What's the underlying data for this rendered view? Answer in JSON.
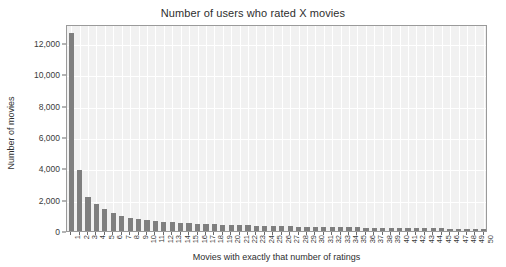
{
  "chart_data": {
    "type": "bar",
    "title": "Number of users who rated X movies",
    "xlabel": "Movies with exactly that number of ratings",
    "ylabel": "Number of movies",
    "grid": true,
    "legend": null,
    "ylim": [
      0,
      13200
    ],
    "xlim": [
      0.5,
      50.5
    ],
    "ytick_labels": [
      "0",
      "2,000",
      "4,000",
      "6,000",
      "8,000",
      "10,000",
      "12,000"
    ],
    "ytick_values": [
      0,
      2000,
      4000,
      6000,
      8000,
      10000,
      12000
    ],
    "categories": [
      "1",
      "2",
      "3",
      "4",
      "5",
      "6",
      "7",
      "8",
      "9",
      "10",
      "11",
      "12",
      "13",
      "14",
      "15",
      "16",
      "17",
      "18",
      "19",
      "20",
      "21",
      "22",
      "23",
      "24",
      "25",
      "26",
      "27",
      "28",
      "29",
      "30",
      "31",
      "32",
      "33",
      "34",
      "35",
      "36",
      "37",
      "38",
      "39",
      "40",
      "41",
      "42",
      "43",
      "44",
      "45",
      "46",
      "47",
      "48",
      "49",
      "50"
    ],
    "values": [
      12600,
      3900,
      2150,
      1750,
      1400,
      1150,
      980,
      860,
      760,
      700,
      640,
      600,
      550,
      520,
      500,
      470,
      450,
      430,
      410,
      400,
      380,
      360,
      350,
      340,
      330,
      300,
      290,
      280,
      270,
      260,
      250,
      245,
      240,
      235,
      225,
      220,
      210,
      205,
      200,
      195,
      185,
      180,
      175,
      170,
      165,
      160,
      155,
      150,
      145,
      140
    ],
    "colors": {
      "bar": "#7f7f7f",
      "plot_background": "#f1f1f1",
      "grid": "#ffffff",
      "axis": "#9a9a9a",
      "text": "#3a3a3a",
      "figure_background": "#ffffff"
    }
  }
}
